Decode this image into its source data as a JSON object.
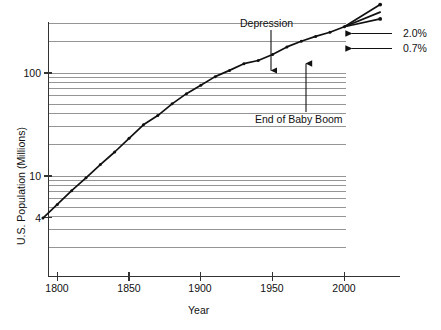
{
  "chart_data": {
    "type": "line",
    "title": "",
    "xlabel": "Year",
    "ylabel": "U.S. Population (Millions)",
    "yscale": "log",
    "xlim": [
      1790,
      2030
    ],
    "ylim": [
      2.6,
      460
    ],
    "grid": true,
    "grid_axis": "y",
    "legend": "none",
    "x_tick_labels": [
      "1800",
      "1850",
      "1900",
      "1950",
      "2000"
    ],
    "x_ticks": [
      1800,
      1850,
      1900,
      1950,
      2000
    ],
    "y_tick_labels": [
      "100",
      "10",
      "4"
    ],
    "y_ticks": [
      100,
      10,
      4
    ],
    "series": [
      {
        "name": "U.S. Population (census)",
        "marker": "dot",
        "x": [
          1790,
          1800,
          1810,
          1820,
          1830,
          1840,
          1850,
          1860,
          1870,
          1880,
          1890,
          1900,
          1910,
          1920,
          1930,
          1940,
          1950,
          1960,
          1970,
          1980,
          1990,
          2000
        ],
        "y": [
          3.9,
          5.3,
          7.2,
          9.6,
          12.9,
          17.1,
          23.2,
          31.4,
          38.6,
          50.2,
          63.0,
          76.2,
          92.2,
          106.0,
          123.2,
          132.2,
          151.3,
          179.3,
          203.3,
          226.5,
          248.7,
          281.4
        ]
      },
      {
        "name": "Projection 2.0%",
        "marker": "dot",
        "x": [
          2000,
          2025
        ],
        "y": [
          281.4,
          462.0
        ]
      },
      {
        "name": "Projection intermediate",
        "marker": "none",
        "x": [
          2000,
          2025
        ],
        "y": [
          281.4,
          390.0
        ]
      },
      {
        "name": "Projection 0.7%",
        "marker": "dot",
        "x": [
          2000,
          2025
        ],
        "y": [
          281.4,
          335.0
        ]
      }
    ],
    "annotations": [
      {
        "text": "Depression",
        "points_to_year": 1945,
        "points_to_value": 137.0,
        "arrow": "down"
      },
      {
        "text": "End of Baby Boom",
        "points_to_year": 1970,
        "points_to_value": 203.3,
        "arrow": "up"
      },
      {
        "text": "2.0%",
        "points_to": "Projection 2.0%",
        "arrow": "left"
      },
      {
        "text": "0.7%",
        "points_to": "Projection 0.7%",
        "arrow": "left"
      }
    ]
  },
  "labels": {
    "x_axis_title": "Year",
    "y_axis_title": "U.S. Population (Millions)",
    "y_tick_100": "100",
    "y_tick_10": "10",
    "y_tick_4": "4",
    "x_tick_1800": "1800",
    "x_tick_1850": "1850",
    "x_tick_1900": "1900",
    "x_tick_1950": "1950",
    "x_tick_2000": "2000",
    "annotation_depression": "Depression",
    "annotation_baby_boom": "End of Baby Boom",
    "rate_high": "2.0%",
    "rate_low": "0.7%"
  },
  "colors": {
    "line": "#111111",
    "grid": "#8a8a8a",
    "axis": "#333333",
    "background": "#ffffff",
    "text": "#111111"
  }
}
